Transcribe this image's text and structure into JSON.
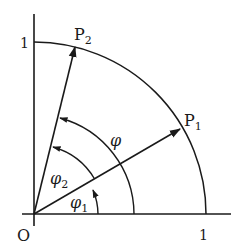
{
  "diagram": {
    "title": "",
    "origin_label": "O",
    "x_axis_tick_label": "1",
    "y_axis_tick_label": "1",
    "points": [
      {
        "name": "P",
        "subscript": "1"
      },
      {
        "name": "P",
        "subscript": "2"
      }
    ],
    "angles": [
      {
        "symbol": "φ",
        "subscript": "1",
        "from": "x-axis",
        "to": "OP1"
      },
      {
        "symbol": "φ",
        "subscript": "2",
        "from": "OP1",
        "to": "OP2"
      },
      {
        "symbol": "φ",
        "subscript": "",
        "from": "x-axis",
        "to": "OP2"
      }
    ],
    "colors": {
      "stroke": "#1a1a1a",
      "background": "#ffffff"
    }
  }
}
